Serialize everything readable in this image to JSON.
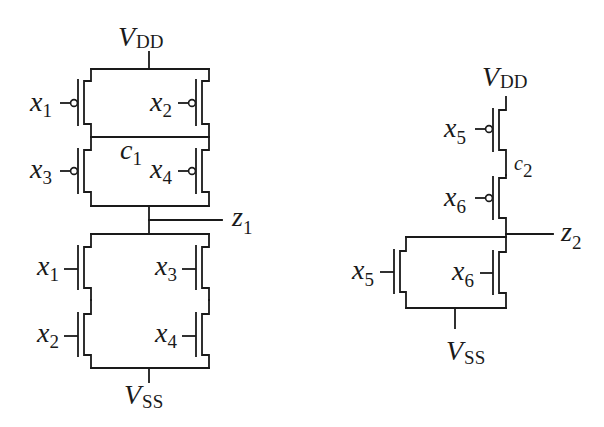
{
  "diagram": {
    "type": "CMOS transistor-level schematics",
    "circuits": [
      {
        "id": "circuit-1",
        "supply_top": {
          "symbol": "V",
          "subscript": "DD"
        },
        "supply_bottom": {
          "symbol": "V",
          "subscript": "SS"
        },
        "output": {
          "symbol": "z",
          "subscript": "1"
        },
        "internal_node": {
          "symbol": "c",
          "subscript": "1"
        },
        "pull_up_pmos": [
          {
            "input": "x",
            "subscript": "1",
            "position": "top-left"
          },
          {
            "input": "x",
            "subscript": "2",
            "position": "top-right"
          },
          {
            "input": "x",
            "subscript": "3",
            "position": "bottom-left"
          },
          {
            "input": "x",
            "subscript": "4",
            "position": "bottom-right"
          }
        ],
        "pull_down_nmos": [
          {
            "input": "x",
            "subscript": "1",
            "position": "top-left"
          },
          {
            "input": "x",
            "subscript": "2",
            "position": "bottom-left"
          },
          {
            "input": "x",
            "subscript": "3",
            "position": "top-right"
          },
          {
            "input": "x",
            "subscript": "4",
            "position": "bottom-right"
          }
        ]
      },
      {
        "id": "circuit-2",
        "supply_top": {
          "symbol": "V",
          "subscript": "DD"
        },
        "supply_bottom": {
          "symbol": "V",
          "subscript": "SS"
        },
        "output": {
          "symbol": "z",
          "subscript": "2"
        },
        "internal_node": {
          "symbol": "c",
          "subscript": "2"
        },
        "pull_up_pmos": [
          {
            "input": "x",
            "subscript": "5",
            "position": "top"
          },
          {
            "input": "x",
            "subscript": "6",
            "position": "bottom"
          }
        ],
        "pull_down_nmos": [
          {
            "input": "x",
            "subscript": "5",
            "position": "left"
          },
          {
            "input": "x",
            "subscript": "6",
            "position": "right"
          }
        ]
      }
    ]
  }
}
